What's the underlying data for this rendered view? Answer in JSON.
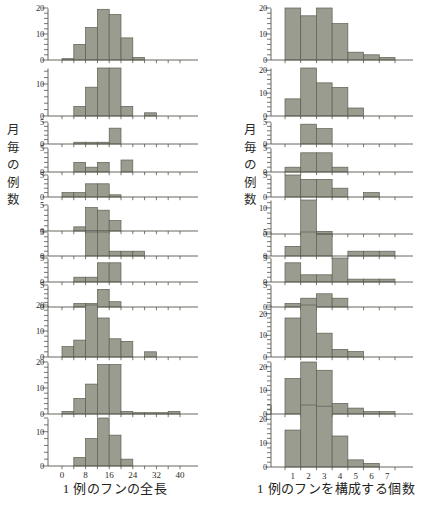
{
  "figure": {
    "panels": [
      {
        "id": "left",
        "y_axis_caption": [
          "月",
          "毎",
          "の",
          "例",
          "数"
        ],
        "x_caption": "1 例のフンの全長",
        "x_unit": "cm",
        "x_ticks": [
          "0",
          "8",
          "16",
          "24",
          "32",
          "40"
        ],
        "x_tick_values": [
          0,
          8,
          16,
          24,
          32,
          40
        ],
        "x_min": 0,
        "x_max": 40,
        "bin_width": 4,
        "charts": [
          {
            "label": "12 月 (70)",
            "month": "12 月",
            "n": 70,
            "ymax": 20,
            "yticks": [
              0,
              10,
              20
            ],
            "values": [
              0.5,
              6,
              12.5,
              19.5,
              17.5,
              8.5,
              1,
              0,
              0,
              0
            ]
          },
          {
            "label": "11 月 (47)",
            "month": "11 月",
            "n": 47,
            "ymax": 15,
            "yticks": [
              0,
              10
            ],
            "values": [
              0,
              3,
              9,
              15,
              15,
              3,
              0,
              1,
              0,
              0
            ]
          },
          {
            "label": "10 月 ( 6)",
            "month": "10 月",
            "n": 6,
            "ymax": 5,
            "yticks": [
              0,
              5
            ],
            "values": [
              0,
              0.4,
              0.4,
              0.4,
              3.6,
              0,
              0,
              0,
              0,
              0
            ]
          },
          {
            "label": "9 月 ( 8)",
            "month": "9 月",
            "n": 8,
            "ymax": 5,
            "yticks": [
              0,
              5
            ],
            "values": [
              0,
              2,
              1,
              2,
              0,
              2.5,
              0,
              0,
              0,
              0
            ]
          },
          {
            "label": "8 月 (12)",
            "month": "8 月",
            "n": 12,
            "ymax": 5,
            "yticks": [
              0,
              5
            ],
            "values": [
              1,
              1,
              3,
              3,
              0.5,
              0,
              0,
              0,
              0,
              0
            ]
          },
          {
            "label": "7 月 (14)",
            "month": "7 月",
            "n": 14,
            "ymax": 5,
            "yticks": [
              0,
              5
            ],
            "values": [
              0,
              0.8,
              4.5,
              4,
              2,
              0,
              0,
              0,
              0,
              0
            ]
          },
          {
            "label": "6 月 (13)",
            "month": "6 月",
            "n": 13,
            "ymax": 5,
            "yticks": [
              0,
              5
            ],
            "values": [
              0,
              0,
              5,
              5,
              1,
              1,
              1,
              0,
              0,
              0
            ]
          },
          {
            "label": "5 月 (10)",
            "month": "5 月",
            "n": 10,
            "ymax": 5,
            "yticks": [
              0,
              5
            ],
            "values": [
              0,
              1,
              1,
              4,
              4,
              0,
              0,
              0,
              0,
              0
            ]
          },
          {
            "label": "4 月 ( 7)",
            "month": "4 月",
            "n": 7,
            "ymax": 5,
            "yticks": [
              0,
              5
            ],
            "values": [
              0,
              0.8,
              0.8,
              4,
              1.2,
              0,
              0,
              0,
              0,
              0
            ]
          },
          {
            "label": "3 月 (51)",
            "month": "3 月",
            "n": 51,
            "ymax": 20,
            "yticks": [
              0,
              10,
              20
            ],
            "values": [
              4,
              6.5,
              20,
              15,
              7,
              6,
              0,
              2,
              0,
              0
            ]
          },
          {
            "label": "2 月 (56)",
            "month": "2 月",
            "n": 56,
            "ymax": 20,
            "yticks": [
              0,
              10,
              20
            ],
            "values": [
              1,
              6,
              11.5,
              19,
              19,
              1,
              0.5,
              0.5,
              0.5,
              1
            ]
          },
          {
            "label": "1 月 (31)",
            "month": "1 月",
            "n": 31,
            "ymax": 14,
            "yticks": [
              0,
              10
            ],
            "values": [
              0,
              2.5,
              8,
              14,
              9,
              2,
              0,
              0,
              0,
              0
            ]
          }
        ]
      },
      {
        "id": "right",
        "y_axis_caption": [
          "月",
          "毎",
          "の",
          "例",
          "数"
        ],
        "x_caption": "1 例のフンを構成する個数",
        "x_unit": "個",
        "x_ticks": [
          "1",
          "2",
          "3",
          "4",
          "5",
          "6",
          "7"
        ],
        "x_tick_values": [
          1,
          2,
          3,
          4,
          5,
          6,
          7
        ],
        "x_min": 0.5,
        "x_max": 7.5,
        "bin_width": 1,
        "charts": [
          {
            "label": "12 月 (75)",
            "month": "12 月",
            "n": 75,
            "ymax": 20,
            "yticks": [
              0,
              10,
              20
            ],
            "values": [
              20,
              17,
              20,
              14,
              3,
              2,
              1
            ]
          },
          {
            "label": "11 月 (59)",
            "month": "11 月",
            "n": 59,
            "ymax": 21,
            "yticks": [
              0,
              10,
              20
            ],
            "values": [
              7.5,
              21,
              14.5,
              12.5,
              3.5,
              0,
              0
            ]
          },
          {
            "label": "10 月 ( 8)",
            "month": "10 月",
            "n": 8,
            "ymax": 5,
            "yticks": [
              0,
              5
            ],
            "values": [
              0,
              4.5,
              3.5,
              0,
              0,
              0,
              0
            ]
          },
          {
            "label": "9 月 (10)",
            "month": "9 月",
            "n": 10,
            "ymax": 5,
            "yticks": [
              0,
              5
            ],
            "values": [
              1,
              4,
              4,
              1,
              0,
              0,
              0
            ]
          },
          {
            "label": "8 月 (16)",
            "month": "8 月",
            "n": 16,
            "ymax": 5,
            "yticks": [
              0,
              5
            ],
            "values": [
              5,
              4,
              4,
              2,
              0,
              1,
              0
            ]
          },
          {
            "label": "7 月 (17)",
            "month": "7 月",
            "n": 17,
            "ymax": 13,
            "yticks": [
              0,
              10
            ],
            "values": [
              0,
              13,
              1,
              0,
              0,
              0,
              0
            ]
          },
          {
            "label": "6 月 (15)",
            "month": "6 月",
            "n": 15,
            "ymax": 5,
            "yticks": [
              0,
              5
            ],
            "values": [
              2,
              5,
              4.5,
              0,
              1,
              1,
              1
            ]
          },
          {
            "label": "5 月 (16)",
            "month": "5 月",
            "n": 16,
            "ymax": 5,
            "yticks": [
              0,
              5
            ],
            "values": [
              4,
              1.5,
              1.5,
              5,
              0.6,
              0.6,
              0.6
            ]
          },
          {
            "label": "4 月 ( 8)",
            "month": "4 月",
            "n": 8,
            "ymax": 5,
            "yticks": [
              0,
              5
            ],
            "values": [
              0.8,
              2,
              3,
              2,
              0,
              0,
              0
            ]
          },
          {
            "label": "3 月 (55)",
            "month": "3 月",
            "n": 55,
            "ymax": 24,
            "yticks": [
              0,
              10,
              20
            ],
            "values": [
              18,
              24,
              11,
              3.5,
              2.5,
              0,
              0
            ]
          },
          {
            "label": "2 月 (59)",
            "month": "2 月",
            "n": 59,
            "ymax": 22,
            "yticks": [
              0,
              10,
              20
            ],
            "values": [
              15,
              22,
              18.5,
              4.5,
              2.5,
              1,
              1
            ]
          },
          {
            "label": "1 月 (79)",
            "month": "1 月",
            "n": 79,
            "ymax": 26,
            "yticks": [
              0,
              10,
              20
            ],
            "values": [
              15.5,
              26,
              25.5,
              13,
              3,
              1.5,
              0
            ]
          }
        ]
      }
    ],
    "colors": {
      "bar_fill": "#9a9c8f",
      "bar_stroke": "#5c5e52",
      "axis": "#55564c",
      "text": "#2a2a28",
      "background": "#ffffff"
    }
  }
}
